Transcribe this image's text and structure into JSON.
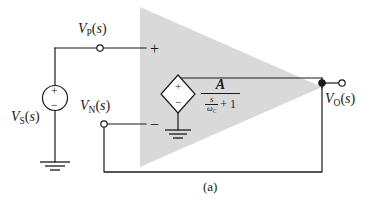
{
  "figure": {
    "caption": "(a)",
    "background_color": "#ffffff",
    "line_color": "#1a1a1a",
    "amplifier_fill": "#d9d9d9"
  },
  "labels": {
    "source": {
      "var": "V",
      "sub": "S",
      "arg": "(s)",
      "full": "V_S(s)"
    },
    "noninverting_node": {
      "var": "V",
      "sub": "P",
      "arg": "(s)",
      "full": "V_P(s)"
    },
    "inverting_node": {
      "var": "V",
      "sub": "N",
      "arg": "(s)",
      "full": "V_N(s)"
    },
    "output_node": {
      "var": "V",
      "sub": "O",
      "arg": "(s)",
      "full": "V_O(s)"
    }
  },
  "amplifier": {
    "name": "op-amp-triangle",
    "noninverting_sign": "+",
    "inverting_sign": "−"
  },
  "independent_source": {
    "name": "vs-source",
    "shape": "circle",
    "plus": "+",
    "minus": "−"
  },
  "dependent_source": {
    "name": "dependent-voltage-source",
    "shape": "diamond",
    "plus": "+",
    "minus": "−"
  },
  "gain_expression": {
    "numerator": "A",
    "denominator_fraction_numerator": "s",
    "denominator_fraction_denominator_var": "ω",
    "denominator_fraction_denominator_sub": "C",
    "denominator_trailing": "+ 1",
    "plain": "A / (s/ωC + 1)"
  },
  "grounds": [
    {
      "name": "ground-source",
      "label": "earth-ground"
    },
    {
      "name": "ground-dependent-source",
      "label": "earth-ground"
    }
  ],
  "terminals": [
    {
      "name": "terminal-vp",
      "type": "open-circle"
    },
    {
      "name": "terminal-vn",
      "type": "open-circle"
    },
    {
      "name": "terminal-vo",
      "type": "open-circle"
    },
    {
      "name": "node-vo",
      "type": "filled-dot"
    }
  ]
}
